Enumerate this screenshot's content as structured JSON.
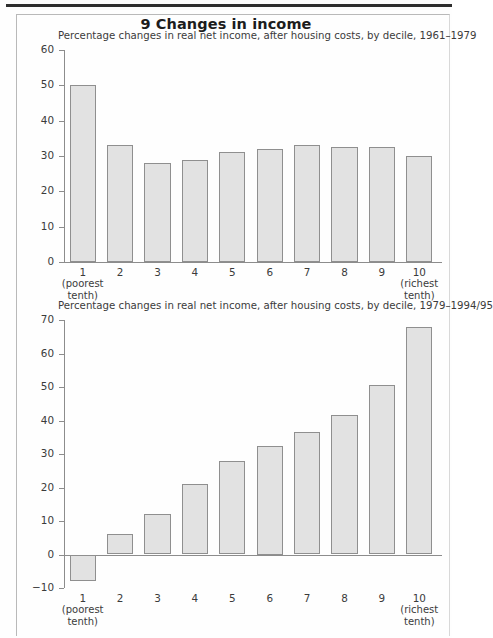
{
  "figure": {
    "title": "9 Changes in income"
  },
  "chart_data": [
    {
      "type": "bar",
      "title": "Percentage changes in real net income, after housing costs, by decile, 1961–1979",
      "xlabel": "",
      "ylabel": "",
      "ylim": [
        0,
        60
      ],
      "yticks": [
        0,
        10,
        20,
        30,
        40,
        50,
        60
      ],
      "grid": false,
      "legend": "none",
      "categories": [
        "1",
        "2",
        "3",
        "4",
        "5",
        "6",
        "7",
        "8",
        "9",
        "10"
      ],
      "category_notes": {
        "first": "(poorest\ntenth)",
        "first_line1": "(poorest",
        "first_line2": "tenth)",
        "last_line1": "(richest",
        "last_line2": "tenth)"
      },
      "values": [
        50,
        33,
        28,
        29,
        31,
        32,
        33,
        32.5,
        32.5,
        30
      ]
    },
    {
      "type": "bar",
      "title": "Percentage changes in real net income, after housing costs, by decile, 1979–1994/95",
      "xlabel": "",
      "ylabel": "",
      "ylim": [
        -10,
        70
      ],
      "yticks": [
        -10,
        0,
        10,
        20,
        30,
        40,
        50,
        60,
        70
      ],
      "grid": false,
      "legend": "none",
      "categories": [
        "1",
        "2",
        "3",
        "4",
        "5",
        "6",
        "7",
        "8",
        "9",
        "10"
      ],
      "category_notes": {
        "first_line1": "(poorest",
        "first_line2": "tenth)",
        "last_line1": "(richest",
        "last_line2": "tenth)"
      },
      "values": [
        -8,
        6,
        12,
        21,
        28,
        32.5,
        36.5,
        41.5,
        50.5,
        68
      ]
    }
  ],
  "colors": {
    "bar_fill": "#e2e2e2",
    "bar_stroke": "#8f8f8f",
    "axis": "#8c8c8c",
    "text": "#3b3b3b",
    "title": "#1c1c1c",
    "rule": "#2e2e2e"
  }
}
